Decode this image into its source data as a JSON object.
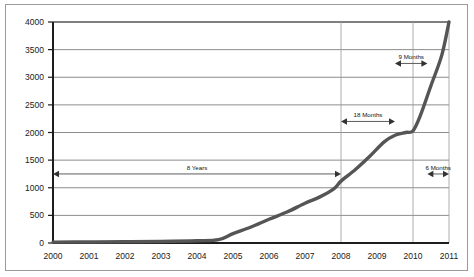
{
  "chart_data": {
    "type": "line",
    "title": "",
    "subtitle": "",
    "xlabel": "",
    "ylabel": "",
    "xlim": [
      2000,
      2011
    ],
    "ylim": [
      0,
      4000
    ],
    "grid": true,
    "legend": "none",
    "x_tick_labels": [
      "2000",
      "2001",
      "2002",
      "2003",
      "2004",
      "2005",
      "2006",
      "2007",
      "2008",
      "2009",
      "2010",
      "2011"
    ],
    "y_tick_labels": [
      "0",
      "500",
      "1000",
      "1500",
      "2000",
      "2500",
      "3000",
      "3500",
      "4000"
    ],
    "y_ticks": [
      0,
      500,
      1000,
      1500,
      2000,
      2500,
      3000,
      3500,
      4000
    ],
    "series": [
      {
        "name": "Growth",
        "color": "#555555",
        "x": [
          2000,
          2001,
          2002,
          2003,
          2004,
          2004.6,
          2005,
          2005.5,
          2006,
          2006.5,
          2007,
          2007.4,
          2007.8,
          2008,
          2008.4,
          2008.8,
          2009.2,
          2009.5,
          2009.8,
          2010.0,
          2010.2,
          2010.5,
          2010.8,
          2011
        ],
        "values": [
          15,
          18,
          22,
          28,
          40,
          60,
          170,
          290,
          430,
          560,
          720,
          830,
          980,
          1120,
          1330,
          1570,
          1830,
          1950,
          2000,
          2030,
          2300,
          2850,
          3400,
          4000
        ]
      }
    ],
    "annotations": [
      {
        "label": "8 Years",
        "x_start": 2000.0,
        "x_end": 2008.0,
        "y": 1250,
        "arrows": "both"
      },
      {
        "label": "18 Months",
        "x_start": 2008.0,
        "x_end": 2009.5,
        "y": 2200,
        "arrows": "both"
      },
      {
        "label": "9 Months",
        "x_start": 2009.5,
        "x_end": 2010.4,
        "y": 3250,
        "arrows": "both"
      },
      {
        "label": "6 Months",
        "x_start": 2010.4,
        "x_end": 2011.0,
        "y": 1250,
        "arrows": "both"
      }
    ]
  }
}
